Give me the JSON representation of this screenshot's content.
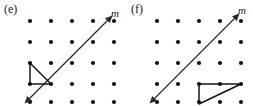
{
  "figure": {
    "background_color": "#ffffff",
    "ink_color": "#141414",
    "panels": [
      {
        "id": "e",
        "label": "(e)",
        "grid": {
          "columns": 5,
          "rows": 5,
          "origin_x": 30,
          "origin_y": 21,
          "spacing": 21,
          "dot_radius": 2.1,
          "dot_color": "#111111"
        },
        "line": {
          "name": "m",
          "label": "m",
          "label_x": 111,
          "label_y": 8,
          "slope": "1 (45 degrees, rising left to right)",
          "direction": "both",
          "arrowheads": 2,
          "x1": 30,
          "y1": 102,
          "x2": 111,
          "y2": 21,
          "passes_through_dots": [
            [
              0,
              4
            ],
            [
              1,
              3
            ],
            [
              2,
              2
            ],
            [
              3,
              1
            ],
            [
              4,
              0
            ]
          ],
          "color": "#2a2a2a",
          "stroke_width": 1.15
        },
        "shape": {
          "name": "triangle",
          "type": "right-triangle",
          "vertices_grid": [
            [
              0,
              2
            ],
            [
              0,
              3
            ],
            [
              1,
              3
            ]
          ],
          "vertices_px": [
            [
              30,
              63
            ],
            [
              30,
              84
            ],
            [
              51,
              84
            ]
          ],
          "legs": "vertical left leg and horizontal bottom leg",
          "position_relative_to_line": "left of line m",
          "color": "#141414",
          "stroke_width": 1.5
        }
      },
      {
        "id": "f",
        "label": "(f)",
        "grid": {
          "columns": 5,
          "rows": 5,
          "origin_x": 30,
          "origin_y": 21,
          "spacing": 21,
          "dot_radius": 2.1,
          "dot_color": "#111111"
        },
        "line": {
          "name": "m",
          "label": "m",
          "label_x": 111,
          "label_y": 5,
          "slope": "1 (45 degrees, rising left to right)",
          "direction": "both",
          "arrowheads": 2,
          "x1": 27,
          "y1": 102,
          "x2": 111,
          "y2": 18,
          "passes_through_dots": [
            [
              0,
              4
            ],
            [
              1,
              3
            ],
            [
              2,
              2
            ],
            [
              3,
              1
            ],
            [
              4,
              0
            ]
          ],
          "color": "#2a2a2a",
          "stroke_width": 1.15
        },
        "shape": {
          "name": "triangle",
          "type": "scalene-triangle",
          "vertices_grid": [
            [
              2,
              3
            ],
            [
              4,
              3
            ],
            [
              2,
              4
            ]
          ],
          "vertices_px": [
            [
              72,
              84
            ],
            [
              114,
              84
            ],
            [
              72,
              105
            ]
          ],
          "legs": "horizontal top leg spanning two units and vertical left leg",
          "position_relative_to_line": "right of and below line m",
          "color": "#141414",
          "stroke_width": 1.5
        }
      }
    ]
  }
}
